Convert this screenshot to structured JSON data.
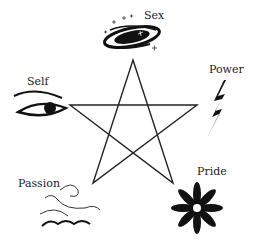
{
  "diagram": {
    "type": "pentagram",
    "points": {
      "top": {
        "label": "Sex",
        "icon": "galaxy-icon"
      },
      "left": {
        "label": "Self",
        "icon": "eye-icon"
      },
      "right": {
        "label": "Power",
        "icon": "lightning-icon"
      },
      "bottom_left": {
        "label": "Passion",
        "icon": "wave-icon"
      },
      "bottom_right": {
        "label": "Pride",
        "icon": "flower-icon"
      }
    },
    "stroke_color": "#222222"
  }
}
